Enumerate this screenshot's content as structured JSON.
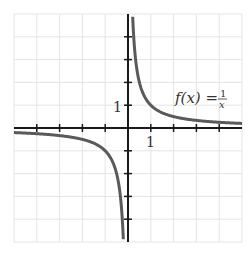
{
  "chart_data": {
    "type": "line",
    "title": "",
    "function": "f(x) = 1/x",
    "annotation": {
      "text_lhs": "f(x) =",
      "numerator": "1",
      "denominator": "x"
    },
    "xlabel": "",
    "ylabel": "",
    "xlim": [
      -5,
      5
    ],
    "ylim": [
      -5,
      5
    ],
    "grid": true,
    "tick_labels": {
      "x": [
        "1"
      ],
      "y": [
        "1"
      ]
    },
    "series": [
      {
        "name": "f(x) = 1/x (x>0)",
        "x": [
          0.2,
          0.25,
          0.5,
          1,
          2,
          3,
          4,
          5
        ],
        "y": [
          5,
          4,
          2,
          1,
          0.5,
          0.333,
          0.25,
          0.2
        ]
      },
      {
        "name": "f(x) = 1/x (x<0)",
        "x": [
          -5,
          -4,
          -3,
          -2,
          -1,
          -0.5,
          -0.25,
          -0.2
        ],
        "y": [
          -0.2,
          -0.25,
          -0.333,
          -0.5,
          -1,
          -2,
          -4,
          -5
        ]
      }
    ],
    "colors": {
      "curve": "#5a5a5a",
      "axis": "#1a1a1a",
      "grid": "#e4e4e4"
    }
  }
}
